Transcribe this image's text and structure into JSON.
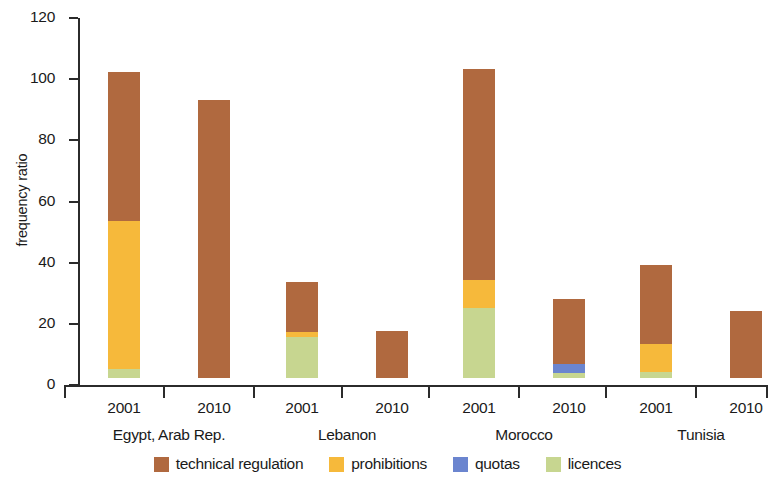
{
  "chart_data": {
    "type": "bar",
    "stacked": true,
    "title": "",
    "subtitle": "",
    "xlabel": "",
    "ylabel": "frequency ratio",
    "ylim": [
      0,
      120
    ],
    "ytick_values": [
      0,
      20,
      40,
      60,
      80,
      100,
      120
    ],
    "ytick_labels": [
      "0",
      "20",
      "40",
      "60",
      "80",
      "100",
      "120"
    ],
    "grid": false,
    "legend_position": "bottom",
    "categories": [
      "2001",
      "2010",
      "2001",
      "2010",
      "2001",
      "2010",
      "2001",
      "2010"
    ],
    "groups": [
      {
        "name": "Egypt, Arab Rep.",
        "years": [
          "2001",
          "2010"
        ]
      },
      {
        "name": "Lebanon",
        "years": [
          "2001",
          "2010"
        ]
      },
      {
        "name": "Morocco",
        "years": [
          "2001",
          "2010"
        ]
      },
      {
        "name": "Tunisia",
        "years": [
          "2001",
          "2010"
        ]
      }
    ],
    "series": [
      {
        "name": "licences",
        "color": "#c7d690",
        "values": [
          3.0,
          0.0,
          13.5,
          0.0,
          23.0,
          1.5,
          2.0,
          0.0
        ]
      },
      {
        "name": "quotas",
        "color": "#6b85cf",
        "values": [
          0.0,
          0.0,
          0.0,
          0.0,
          0.0,
          3.0,
          0.0,
          0.0
        ]
      },
      {
        "name": "prohibitions",
        "color": "#f6b93b",
        "values": [
          48.5,
          0.0,
          1.5,
          0.0,
          9.0,
          0.0,
          9.0,
          0.0
        ]
      },
      {
        "name": "technical regulation",
        "color": "#b0693f",
        "values": [
          48.5,
          91.0,
          16.5,
          15.5,
          69.0,
          21.5,
          26.0,
          22.0
        ]
      }
    ],
    "totals": [
      100.0,
      91.0,
      31.5,
      15.5,
      101.0,
      26.0,
      37.0,
      22.0
    ]
  },
  "legend": {
    "items": [
      {
        "label": "technical regulation",
        "color": "#b0693f"
      },
      {
        "label": "prohibitions",
        "color": "#f6b93b"
      },
      {
        "label": "quotas",
        "color": "#6b85cf"
      },
      {
        "label": "licences",
        "color": "#c7d690"
      }
    ]
  }
}
